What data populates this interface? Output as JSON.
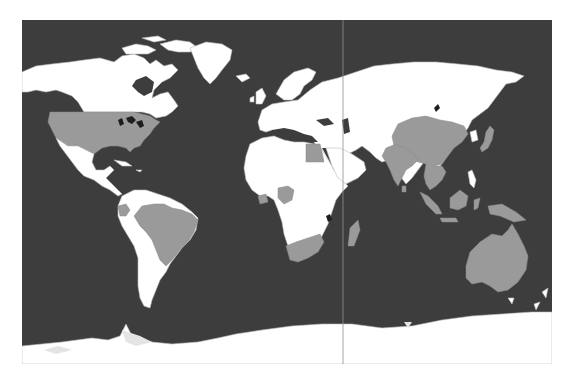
{
  "map": {
    "type": "choropleth-world-map",
    "projection": "equirectangular",
    "colors": {
      "ocean": "#3d3d3d",
      "land": "#ffffff",
      "highlighted": "#9a9a9a",
      "borders": "#bdbdbd",
      "lakes": "#1e1e1e",
      "ice_shelf": "#e4e4e4",
      "page_background": "#ffffff"
    },
    "highlighted_countries": [
      "United States",
      "Ecuador",
      "Brazil",
      "Egypt",
      "Nigeria",
      "Côte d'Ivoire",
      "South Africa",
      "Madagascar",
      "China",
      "India",
      "Sri Lanka",
      "Thailand",
      "Laos",
      "Vietnam",
      "Cambodia",
      "Indonesia",
      "Papua New Guinea",
      "Japan",
      "Australia"
    ],
    "vertical_reference_line": {
      "visible": true
    }
  }
}
